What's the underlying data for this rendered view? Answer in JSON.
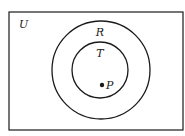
{
  "diagram": {
    "type": "venn",
    "universe": {
      "label": "U",
      "x": 9,
      "y": 12,
      "width": 174,
      "height": 118
    },
    "sets": [
      {
        "label": "R",
        "cx": 101,
        "cy": 70,
        "r": 49,
        "label_x": 100,
        "label_y": 36
      },
      {
        "label": "T",
        "cx": 100,
        "cy": 70,
        "r": 28,
        "label_x": 100,
        "label_y": 57
      }
    ],
    "points": [
      {
        "label": "P",
        "x": 102,
        "y": 85,
        "label_x": 109,
        "label_y": 89,
        "inside": [
          "T",
          "R",
          "U"
        ]
      }
    ],
    "colors": {
      "stroke": "#1a1a1a",
      "background": "#ffffff"
    }
  }
}
